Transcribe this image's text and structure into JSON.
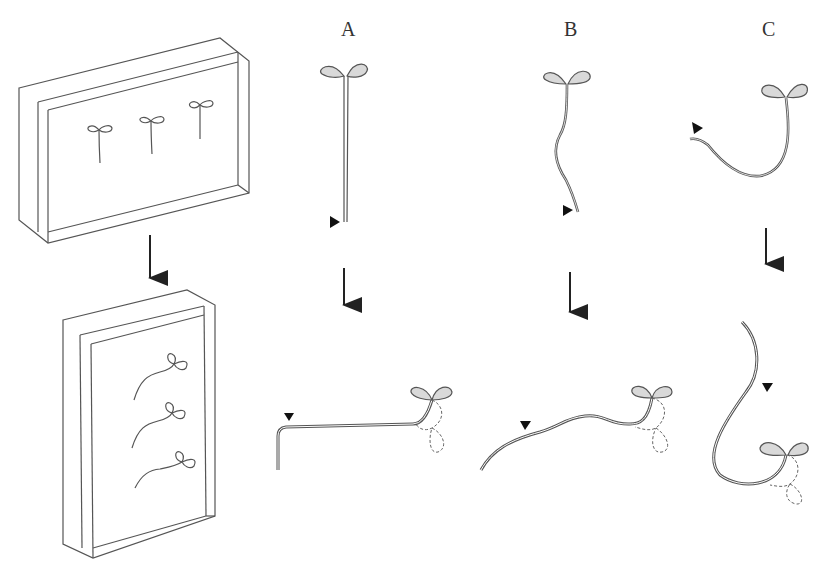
{
  "figure": {
    "panel_labels": [
      "A",
      "B",
      "C"
    ],
    "left_setup": {
      "top_box": "transparent box with three seedlings, upright orientation",
      "bottom_box": "box rotated 90 degrees, seedlings curved"
    },
    "colors": {
      "line": "#444444",
      "cotyledon_fill": "#d9d9d9",
      "arrow": "#222222",
      "marker": "#111111"
    },
    "icons": [
      "down-arrow-icon",
      "triangle-marker-icon",
      "seedling-icon"
    ]
  }
}
